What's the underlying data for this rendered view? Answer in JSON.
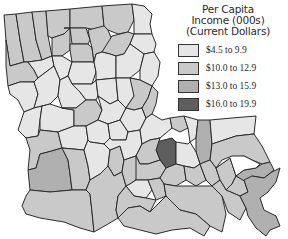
{
  "map": {
    "region": "Louisiana parishes",
    "stroke_color": "#2b2b2b",
    "background": "#ffffff"
  },
  "legend": {
    "title_line1": "Per Capita",
    "title_line2": "Income (000s)",
    "title_line3": "(Current Dollars)",
    "items": [
      {
        "label": "$4.5 to 9.9",
        "color": "#e6e6e6"
      },
      {
        "label": "$10.0 to 12.9",
        "color": "#c9c9c9"
      },
      {
        "label": "$13.0 to 15.9",
        "color": "#b0b0b0"
      },
      {
        "label": "$16.0 to 19.9",
        "color": "#5e5e5e"
      }
    ]
  }
}
